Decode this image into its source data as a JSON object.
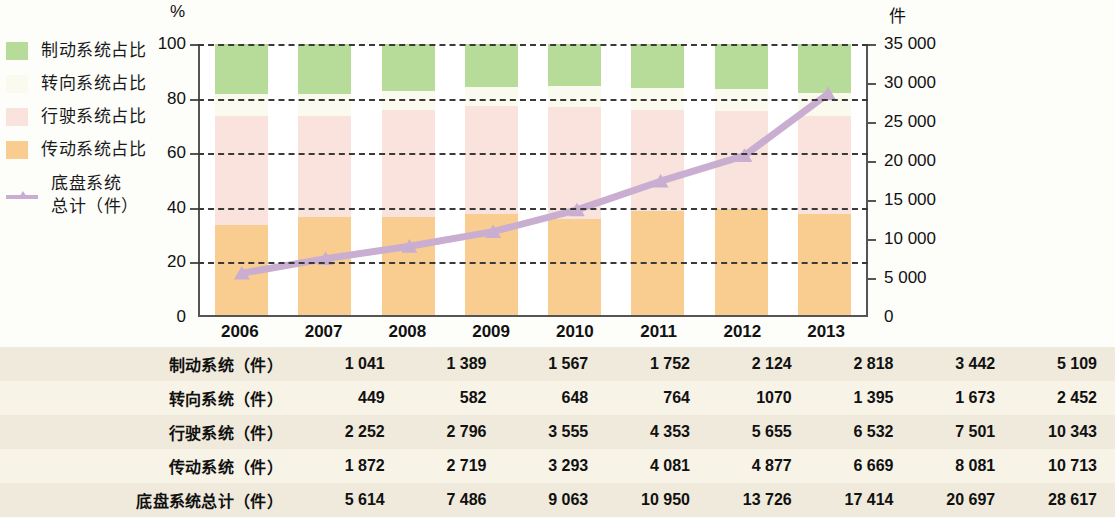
{
  "axes": {
    "left_unit": "%",
    "right_unit": "件",
    "left_ticks": [
      "100",
      "80",
      "60",
      "40",
      "20",
      "0"
    ],
    "right_ticks": [
      "35 000",
      "30 000",
      "25 000",
      "20 000",
      "15 000",
      "10 000",
      "5 000",
      "0"
    ]
  },
  "legend": {
    "items": [
      {
        "label": "制动系统占比",
        "color": "#b7dc9a",
        "type": "swatch"
      },
      {
        "label": "转向系统占比",
        "color": "#fbfaee",
        "type": "swatch"
      },
      {
        "label": "行驶系统占比",
        "color": "#f9e3dc",
        "type": "swatch"
      },
      {
        "label": "传动系统占比",
        "color": "#f8cd8f",
        "type": "swatch"
      },
      {
        "label": "底盘系统\n总计（件）",
        "color": "#c9aed1",
        "type": "line"
      }
    ]
  },
  "table": {
    "years": [
      "2006",
      "2007",
      "2008",
      "2009",
      "2010",
      "2011",
      "2012",
      "2013"
    ],
    "rows": [
      {
        "label": "制动系统（件）",
        "values": [
          "1 041",
          "1 389",
          "1 567",
          "1 752",
          "2 124",
          "2 818",
          "3 442",
          "5 109"
        ]
      },
      {
        "label": "转向系统（件）",
        "values": [
          "449",
          "582",
          "648",
          "764",
          "1070",
          "1 395",
          "1 673",
          "2 452"
        ]
      },
      {
        "label": "行驶系统（件）",
        "values": [
          "2 252",
          "2 796",
          "3 555",
          "4 353",
          "5 655",
          "6 532",
          "7 501",
          "10 343"
        ]
      },
      {
        "label": "传动系统（件）",
        "values": [
          "1 872",
          "2 719",
          "3 293",
          "4 081",
          "4 877",
          "6 669",
          "8 081",
          "10 713"
        ]
      },
      {
        "label": "底盘系统总计（件）",
        "values": [
          "5 614",
          "7 486",
          "9 063",
          "10 950",
          "13 726",
          "17 414",
          "20 697",
          "28 617"
        ]
      }
    ]
  },
  "chart_data": {
    "type": "bar",
    "subtype": "stacked-percent-with-line",
    "title": "",
    "xlabel": "",
    "ylabel": "%",
    "y2label": "件",
    "ylim": [
      0,
      100
    ],
    "y2lim": [
      0,
      35000
    ],
    "grid": true,
    "legend_position": "left",
    "categories": [
      "2006",
      "2007",
      "2008",
      "2009",
      "2010",
      "2011",
      "2012",
      "2013"
    ],
    "series": [
      {
        "name": "传动系统占比",
        "color": "#f8cd8f",
        "stack_order": 1,
        "raw": [
          1872,
          2719,
          3293,
          4081,
          4877,
          6669,
          8081,
          10713
        ],
        "values": [
          33.3,
          36.3,
          36.3,
          37.3,
          35.5,
          38.3,
          39.0,
          37.4
        ]
      },
      {
        "name": "行驶系统占比",
        "color": "#f9e3dc",
        "stack_order": 2,
        "raw": [
          2252,
          2796,
          3555,
          4353,
          5655,
          6532,
          7501,
          10343
        ],
        "values": [
          40.1,
          37.3,
          39.2,
          39.8,
          41.2,
          37.5,
          36.2,
          36.1
        ]
      },
      {
        "name": "转向系统占比",
        "color": "#fbfaee",
        "stack_order": 3,
        "raw": [
          449,
          582,
          648,
          764,
          1070,
          1395,
          1673,
          2452
        ],
        "values": [
          8.0,
          7.8,
          7.1,
          7.0,
          7.8,
          8.0,
          8.1,
          8.6
        ]
      },
      {
        "name": "制动系统占比",
        "color": "#b7dc9a",
        "stack_order": 4,
        "raw": [
          1041,
          1389,
          1567,
          1752,
          2124,
          2818,
          3442,
          5109
        ],
        "values": [
          18.5,
          18.6,
          17.3,
          16.0,
          15.5,
          16.2,
          16.6,
          17.9
        ]
      }
    ],
    "line_series": {
      "name": "底盘系统总计（件）",
      "color": "#c9aed1",
      "axis": "y2",
      "marker": "triangle",
      "values": [
        5614,
        7486,
        9063,
        10950,
        13726,
        17414,
        20697,
        28617
      ]
    }
  }
}
